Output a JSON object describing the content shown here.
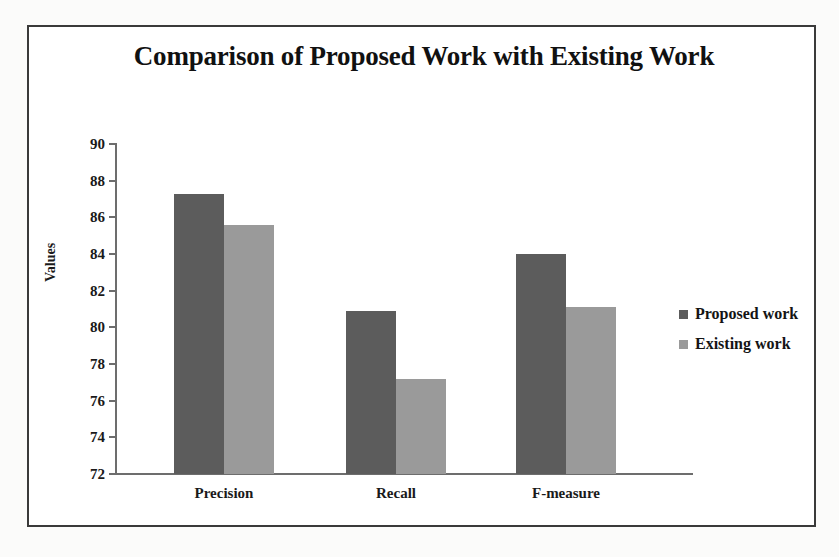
{
  "chart_data": {
    "type": "bar",
    "title": "Comparison of Proposed Work with Existing Work",
    "xlabel": "",
    "ylabel": "Values",
    "categories": [
      "Precision",
      "Recall",
      "F-measure"
    ],
    "series": [
      {
        "name": "Proposed work",
        "color": "#5c5c5c",
        "values": [
          87.3,
          80.9,
          84.0
        ]
      },
      {
        "name": "Existing work",
        "color": "#9a9a9a",
        "values": [
          85.6,
          77.2,
          81.1
        ]
      }
    ],
    "ylim": [
      72,
      90
    ],
    "ytick_step": 2,
    "yticks": [
      90,
      88,
      86,
      84,
      82,
      80,
      78,
      76,
      74,
      72
    ],
    "grid": false,
    "legend_position": "right"
  },
  "legend": {
    "items": [
      {
        "label": "Proposed work",
        "marker": "square-swatch-dark"
      },
      {
        "label": "Existing work",
        "marker": "square-swatch-light"
      }
    ]
  },
  "colors": {
    "series_proposed": "#5c5c5c",
    "series_existing": "#9a9a9a",
    "axis": "#6d6d6d",
    "frame": "#3a3a3a",
    "text": "#1a1a1a"
  }
}
